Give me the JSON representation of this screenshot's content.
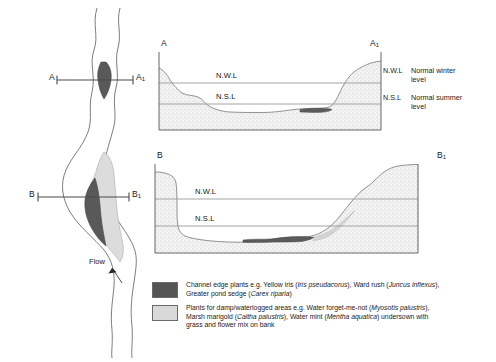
{
  "diagram": {
    "plan": {
      "section_a_label": "A",
      "section_a1_label": "A",
      "section_a1_sub": "1",
      "section_b_label": "B",
      "section_b1_label": "B",
      "section_b1_sub": "1",
      "flow_label": "Flow"
    },
    "section_top": {
      "left_label": "A",
      "right_label": "A",
      "right_label_sub": "1",
      "nwl_label": "N.W.L",
      "nsl_label": "N.S.L"
    },
    "section_bottom": {
      "left_label": "B",
      "right_label": "B",
      "right_label_sub": "1",
      "nwl_label": "N.W.L",
      "nsl_label": "N.S.L"
    },
    "key": {
      "entries": [
        {
          "abbr": "N.W.L",
          "line1": "Normal winter",
          "line2": "level"
        },
        {
          "abbr": "N.S.L",
          "line1": "Normal summer",
          "line2": "level"
        }
      ]
    },
    "legend": {
      "entries": [
        {
          "swatch_color": "#555555",
          "line1_a": "Channel edge plants e.g. Yellow iris (",
          "line1_i1": "Iris pseudacorus",
          "line1_b": "), Ward rush (",
          "line1_i2": "Juncus inflexus",
          "line1_c": "),",
          "line2_a": "Greater pond sedge (",
          "line2_i1": "Carex riparia",
          "line2_b": ")"
        },
        {
          "swatch_color": "#d9d9d9",
          "line1_a": "Plants for damp/waterlogged areas e.g. Water forget-me-not (",
          "line1_i1": "Myosotis palustris",
          "line1_b": "),",
          "line2_a": "Marsh marigold (",
          "line2_i1": "Caltha palustris",
          "line2_b": "), Water mint (",
          "line2_i2": "Mentha aquatica",
          "line2_c": ") undersown with",
          "line3_a": "grass and flower mix on bank"
        }
      ]
    },
    "colors": {
      "dark_vegetation": "#555555",
      "light_vegetation": "#d9d9d9",
      "bank_stipple": "#efefef",
      "outline": "#666666",
      "water_line": "#9a9a9a",
      "section_line": "#4a4a4a"
    }
  }
}
